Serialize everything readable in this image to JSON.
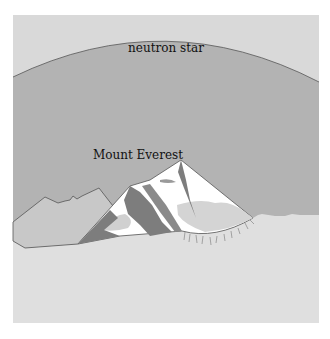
{
  "figure": {
    "labels": {
      "neutron_star": "neutron star",
      "mount_everest": "Mount Everest"
    },
    "colors": {
      "page_background": "#ffffff",
      "sky": "#d9d9d9",
      "neutron_star_fill": "#b3b3b3",
      "ground": "#dfdfdf",
      "rock_dark": "#7d7d7d",
      "rock_mid": "#9a9a9a",
      "snow": "#ffffff",
      "snow_shadow": "#d2d2d2",
      "outline": "#555555"
    }
  }
}
